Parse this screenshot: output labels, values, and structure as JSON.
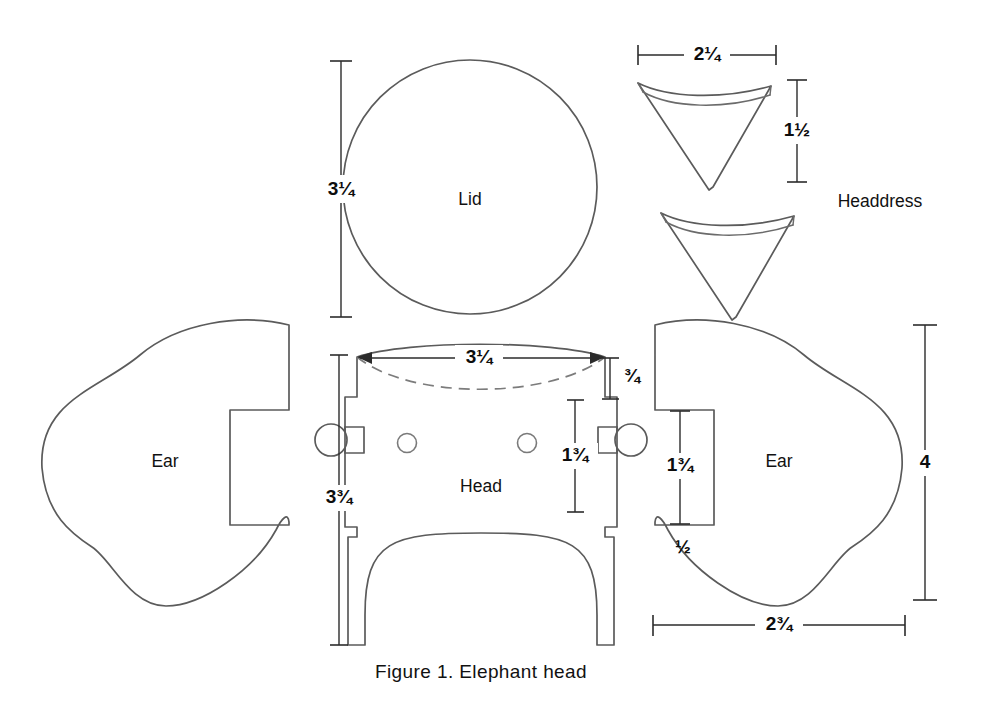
{
  "figure": {
    "caption": "Figure 1. Elephant head",
    "title": "Elephant head",
    "number": "1",
    "units": "inches",
    "background_color": "#ffffff",
    "line_color": "#5b5b5b",
    "text_color": "#111111"
  },
  "pieces": {
    "lid": {
      "label": "Lid",
      "shape": "circle",
      "dimension_height": "3¼"
    },
    "head": {
      "label": "Head",
      "shape": "stepped-rectangle-with-arch",
      "dim_top_width": "3¼",
      "dim_top_band": "¾",
      "dim_side_tab": "1¾",
      "dim_total_height": "3¾",
      "holes": 2,
      "side_tabs": 2
    },
    "ear_left": {
      "label": "Ear",
      "shape": "ear-blob-with-tab",
      "tab_side": "right"
    },
    "ear_right": {
      "label": "Ear",
      "shape": "ear-blob-with-tab",
      "tab_side": "left",
      "dim_tab_height": "1¾",
      "dim_tab_depth": "½",
      "dim_total_height": "4",
      "dim_width": "2¾"
    },
    "headdress": {
      "label": "Headdress",
      "shape": "curved-triangle",
      "count": 2,
      "dim_width": "2¼",
      "dim_height": "1½"
    }
  },
  "dimensions": [
    {
      "id": "lid-height",
      "value": "3¼",
      "orientation": "vertical",
      "piece": "lid"
    },
    {
      "id": "headdress-width",
      "value": "2¼",
      "orientation": "horizontal",
      "piece": "headdress"
    },
    {
      "id": "headdress-height",
      "value": "1½",
      "orientation": "vertical",
      "piece": "headdress"
    },
    {
      "id": "head-top-width",
      "value": "3¼",
      "orientation": "horizontal",
      "piece": "head"
    },
    {
      "id": "head-top-band",
      "value": "¾",
      "orientation": "vertical",
      "piece": "head"
    },
    {
      "id": "head-side-tab",
      "value": "1¾",
      "orientation": "vertical",
      "piece": "head"
    },
    {
      "id": "head-total-height",
      "value": "3¾",
      "orientation": "vertical",
      "piece": "head"
    },
    {
      "id": "ear-tab-height",
      "value": "1¾",
      "orientation": "vertical",
      "piece": "ear_right"
    },
    {
      "id": "ear-tab-depth",
      "value": "½",
      "orientation": "vertical",
      "piece": "ear_right"
    },
    {
      "id": "ear-total-height",
      "value": "4",
      "orientation": "vertical",
      "piece": "ear_right"
    },
    {
      "id": "ear-width",
      "value": "2¾",
      "orientation": "horizontal",
      "piece": "ear_right"
    }
  ]
}
